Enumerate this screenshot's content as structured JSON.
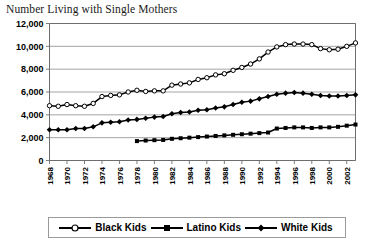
{
  "chart_data": {
    "type": "line",
    "title": "Number Living with Single Mothers",
    "xlabel": "",
    "ylabel": "",
    "ylim": [
      0,
      12000
    ],
    "ytick_labels": [
      "12,000",
      "10,000",
      "8,000",
      "6,000",
      "4,000",
      "2,000",
      "0"
    ],
    "ytick_values": [
      12000,
      10000,
      8000,
      6000,
      4000,
      2000,
      0
    ],
    "xlim": [
      1968,
      2003
    ],
    "xtick_labels": [
      "1968",
      "1970",
      "1972",
      "1974",
      "1976",
      "1978",
      "1980",
      "1982",
      "1984",
      "1986",
      "1988",
      "1990",
      "1992",
      "1994",
      "1996",
      "1998",
      "2000",
      "2002"
    ],
    "xtick_values": [
      1968,
      1970,
      1972,
      1974,
      1976,
      1978,
      1980,
      1982,
      1984,
      1986,
      1988,
      1990,
      1992,
      1994,
      1996,
      1998,
      2000,
      2002
    ],
    "grid": true,
    "grid_axis": "y",
    "legend_position": "bottom",
    "x": [
      1968,
      1969,
      1970,
      1971,
      1972,
      1973,
      1974,
      1975,
      1976,
      1977,
      1978,
      1979,
      1980,
      1981,
      1982,
      1983,
      1984,
      1985,
      1986,
      1987,
      1988,
      1989,
      1990,
      1991,
      1992,
      1993,
      1994,
      1995,
      1996,
      1997,
      1998,
      1999,
      2000,
      2001,
      2002,
      2003
    ],
    "series": [
      {
        "name": "Black Kids",
        "marker": "open-circle",
        "values": [
          4800,
          4750,
          4900,
          4800,
          4750,
          5000,
          5600,
          5700,
          5750,
          6000,
          6150,
          6050,
          6100,
          6100,
          6600,
          6700,
          6800,
          7100,
          7250,
          7500,
          7600,
          7900,
          8150,
          8450,
          8900,
          9500,
          9950,
          10150,
          10200,
          10200,
          10150,
          9800,
          9700,
          9750,
          10000,
          10300
        ]
      },
      {
        "name": "Latino Kids",
        "marker": "filled-square",
        "values": [
          null,
          null,
          null,
          null,
          null,
          null,
          null,
          null,
          null,
          null,
          1700,
          1750,
          1780,
          1800,
          1900,
          1950,
          2000,
          2050,
          2100,
          2150,
          2200,
          2250,
          2300,
          2350,
          2400,
          2450,
          2800,
          2850,
          2900,
          2900,
          2850,
          2900,
          2900,
          2950,
          3050,
          3150
        ]
      },
      {
        "name": "White Kids",
        "marker": "filled-diamond",
        "values": [
          2700,
          2700,
          2700,
          2800,
          2800,
          2950,
          3300,
          3350,
          3400,
          3550,
          3600,
          3700,
          3800,
          3850,
          4100,
          4200,
          4250,
          4400,
          4450,
          4600,
          4700,
          4900,
          5100,
          5200,
          5400,
          5600,
          5800,
          5900,
          5950,
          5900,
          5800,
          5700,
          5650,
          5650,
          5700,
          5750
        ]
      }
    ]
  },
  "legend": {
    "items": [
      {
        "label": "Black Kids",
        "marker": "open-circle"
      },
      {
        "label": "Latino Kids",
        "marker": "filled-square"
      },
      {
        "label": "White Kids",
        "marker": "filled-diamond"
      }
    ]
  },
  "colors": {
    "series_line": "#000000",
    "grid": "#9a9a9a",
    "axis": "#6e6e6e",
    "text": "#000000",
    "title_text": "#1a1a1a",
    "background": "#ffffff"
  }
}
